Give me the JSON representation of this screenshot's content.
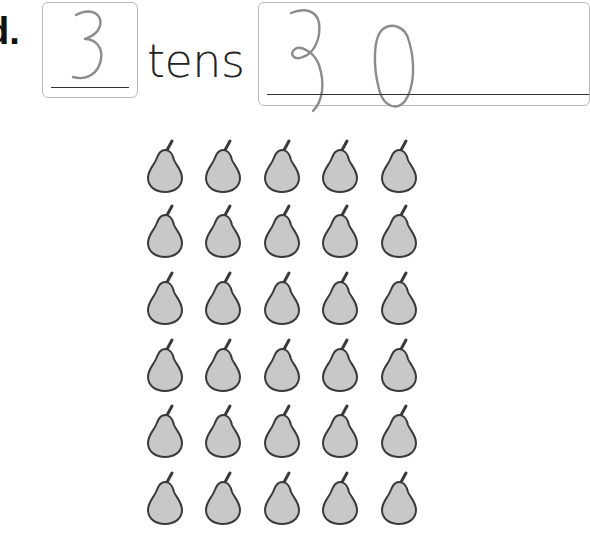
{
  "problem": {
    "label": "d.",
    "tens_count_answer": "3",
    "unit_label": "tens",
    "total_answer": "30"
  },
  "pear_grid": {
    "rows": 6,
    "columns": 5,
    "total": 30,
    "icon": "pear-icon",
    "fill_color": "#c8c8c8",
    "outline_color": "#3a3a3a"
  },
  "handwriting_color": "#8c8c8c"
}
